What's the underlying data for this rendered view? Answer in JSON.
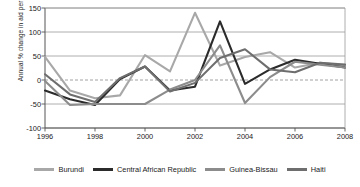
{
  "chart_data": {
    "type": "line",
    "title": "",
    "xlabel": "",
    "ylabel": "Annual % change in aid per capita",
    "x": [
      1996,
      1997,
      1998,
      1999,
      2000,
      2001,
      2002,
      2003,
      2004,
      2005,
      2006,
      2007,
      2008
    ],
    "xlim": [
      1996,
      2008
    ],
    "ylim": [
      -100,
      150
    ],
    "yticks": [
      150,
      100,
      50,
      0,
      -50,
      -100
    ],
    "xticks": [
      1996,
      1998,
      2000,
      2002,
      2004,
      2006,
      2008
    ],
    "grid": true,
    "zero_line": true,
    "legend_position": "bottom",
    "series": [
      {
        "name": "Burundi",
        "color": "#a8a8a8",
        "values": [
          48,
          -22,
          -38,
          -32,
          52,
          18,
          140,
          30,
          48,
          58,
          26,
          36,
          30
        ]
      },
      {
        "name": "Central African Republic",
        "color": "#2b2b2b",
        "values": [
          -22,
          -40,
          -52,
          2,
          28,
          -22,
          -14,
          122,
          -8,
          22,
          42,
          34,
          26
        ]
      },
      {
        "name": "Guinea-Bissau",
        "color": "#8c8c8c",
        "values": [
          -2,
          -52,
          -50,
          -50,
          -50,
          -20,
          0,
          72,
          -48,
          6,
          38,
          32,
          26
        ]
      },
      {
        "name": "Haiti",
        "color": "#6e6e6e",
        "values": [
          12,
          -30,
          -46,
          4,
          28,
          -24,
          -6,
          46,
          64,
          22,
          16,
          36,
          32
        ]
      }
    ]
  },
  "axis": {
    "ytick_labels": [
      "150",
      "100",
      "50",
      "0",
      "-50",
      "-100"
    ],
    "xtick_labels": [
      "1996",
      "1998",
      "2000",
      "2002",
      "2004",
      "2006",
      "2008"
    ]
  },
  "colors": {
    "background": "#ffffff",
    "grid": "#9a9a9a",
    "axis": "#555555",
    "text": "#1a1a1a"
  }
}
